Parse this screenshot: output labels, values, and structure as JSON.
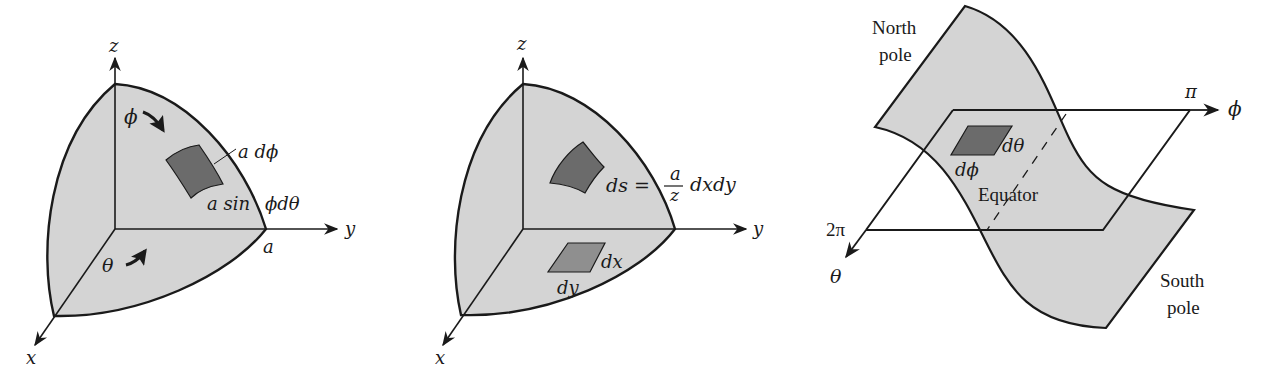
{
  "colors": {
    "surface_fill": "#d4d4d4",
    "patch_fill": "#6b6b6b",
    "small_patch_fill": "#8f8f8f",
    "stroke": "#1a1a1a",
    "background": "#ffffff"
  },
  "panel1": {
    "z_label": "z",
    "y_label": "y",
    "x_label": "x",
    "phi_label": "ϕ",
    "theta_label": "θ",
    "a_dphi_label": "a dϕ",
    "a_sin_label": "a sin",
    "phi_dtheta_label": "ϕdθ",
    "radius_label": "a"
  },
  "panel2": {
    "z_label": "z",
    "y_label": "y",
    "x_label": "x",
    "ds_label": "ds =",
    "frac_num": "a",
    "frac_den": "z",
    "dxdy_label": "dxdy",
    "dx_label": "dx",
    "dy_label": "dy"
  },
  "panel3": {
    "north_pole_line1": "North",
    "north_pole_line2": "pole",
    "south_pole_line1": "South",
    "south_pole_line2": "pole",
    "pi_label": "π",
    "phi_axis_label": "ϕ",
    "two_pi_label": "2π",
    "theta_axis_label": "θ",
    "dtheta_label": "dθ",
    "dphi_label": "dϕ",
    "equator_label": "Equator"
  }
}
